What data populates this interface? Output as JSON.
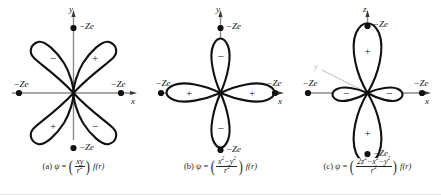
{
  "figure": {
    "type": "orbital-diagram-set",
    "background": "#ffffff",
    "ink": "#1a1a1a",
    "axis_color": "#8a8a8a",
    "panel_count": 3
  },
  "panels": [
    {
      "id": "a",
      "caption_label": "(a)",
      "psi_symbol": "ψ",
      "equals": "=",
      "numerator": "xy",
      "denominator": "r",
      "denominator_exp": "2",
      "radial_factor": "f(r)",
      "orbital_name": "d-xy",
      "lobe_orientation": "diagonal",
      "axes": [
        {
          "name": "y",
          "label": "y",
          "direction": "up"
        },
        {
          "name": "x",
          "label": "x",
          "direction": "right"
        }
      ],
      "charges": [
        {
          "position": "top",
          "label": "−Ze"
        },
        {
          "position": "right",
          "label": "−Ze"
        },
        {
          "position": "bottom",
          "label": "−Ze"
        },
        {
          "position": "left",
          "label": "−Ze"
        }
      ],
      "lobes": [
        {
          "quadrant": "upper-left",
          "sign": "−"
        },
        {
          "quadrant": "upper-right",
          "sign": "+"
        },
        {
          "quadrant": "lower-left",
          "sign": "+"
        },
        {
          "quadrant": "lower-right",
          "sign": "−"
        }
      ]
    },
    {
      "id": "b",
      "caption_label": "(b)",
      "psi_symbol": "ψ",
      "equals": "=",
      "numerator_a": "x",
      "numerator_a_exp": "2",
      "numerator_minus": "−",
      "numerator_b": "y",
      "numerator_b_exp": "2",
      "denominator": "r",
      "denominator_exp": "2",
      "radial_factor": "f(r)",
      "orbital_name": "d-x2-y2",
      "lobe_orientation": "axial",
      "axes": [
        {
          "name": "y",
          "label": "y",
          "direction": "up"
        },
        {
          "name": "x",
          "label": "x",
          "direction": "right"
        }
      ],
      "charges": [
        {
          "position": "top",
          "label": "−Ze"
        },
        {
          "position": "right",
          "label": "−Ze"
        },
        {
          "position": "bottom",
          "label": "−Ze"
        },
        {
          "position": "left",
          "label": "−Ze"
        }
      ],
      "lobes": [
        {
          "direction": "up",
          "sign": "−"
        },
        {
          "direction": "right",
          "sign": "+"
        },
        {
          "direction": "down",
          "sign": "−"
        },
        {
          "direction": "left",
          "sign": "+"
        }
      ]
    },
    {
      "id": "c",
      "caption_label": "(c)",
      "psi_symbol": "ψ",
      "equals": "=",
      "numerator_a": "2z",
      "numerator_a_exp": "2",
      "numerator_minus_1": "−",
      "numerator_b": "x",
      "numerator_b_exp": "2",
      "numerator_minus_2": "−",
      "numerator_c": "y",
      "numerator_c_exp": "2",
      "denominator": "r",
      "denominator_exp": "2",
      "radial_factor": "f(r)",
      "orbital_name": "d-z2",
      "lobe_orientation": "axial-z-with-torus",
      "axes": [
        {
          "name": "z",
          "label": "z",
          "direction": "up"
        },
        {
          "name": "x",
          "label": "x",
          "direction": "right"
        },
        {
          "name": "y",
          "label": "y",
          "direction": "back-left"
        }
      ],
      "charges": [
        {
          "position": "top",
          "label": "−Ze"
        },
        {
          "position": "right",
          "label": "−Ze"
        },
        {
          "position": "bottom",
          "label": "−Ze"
        },
        {
          "position": "left",
          "label": "−Ze"
        }
      ],
      "lobes": [
        {
          "direction": "up",
          "sign": "+",
          "size": "large"
        },
        {
          "direction": "down",
          "sign": "+",
          "size": "large"
        },
        {
          "direction": "left",
          "sign": "−",
          "size": "small"
        },
        {
          "direction": "right",
          "sign": "−",
          "size": "small"
        }
      ]
    }
  ]
}
